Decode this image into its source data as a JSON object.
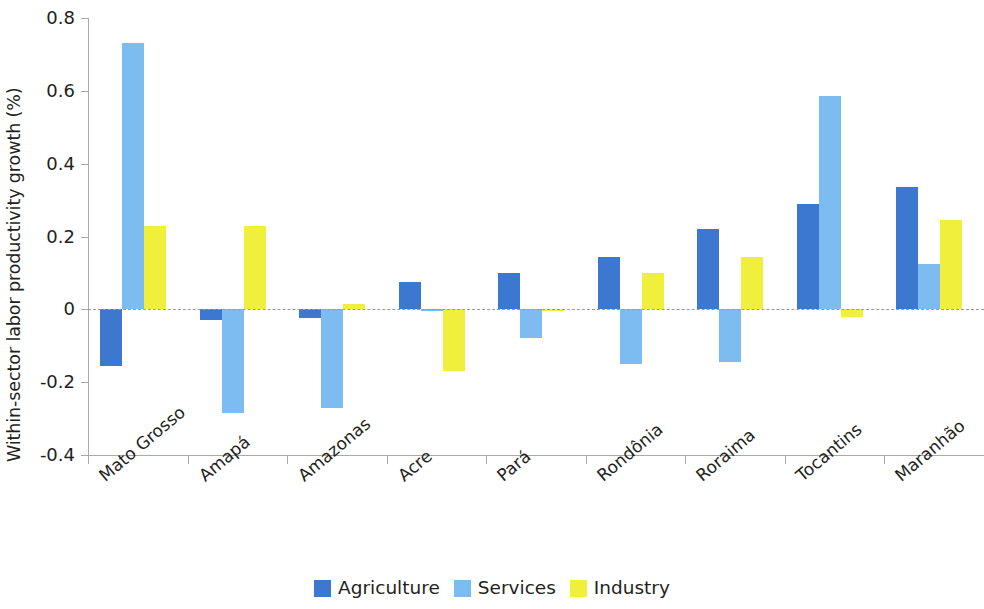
{
  "chart_data": {
    "type": "bar",
    "title": "",
    "xlabel": "",
    "ylabel": "Within-sector labor productivity growth (%)",
    "ylim": [
      -0.4,
      0.8
    ],
    "yticks": [
      0.8,
      0.6,
      0.4,
      0.2,
      0,
      -0.2,
      -0.4
    ],
    "ytick_labels": [
      "0.8",
      "0.6",
      "0.4",
      "0.2",
      "0",
      "-0.2",
      "-0.4"
    ],
    "grid": false,
    "zero_line": true,
    "legend_position": "bottom",
    "categories": [
      "Mato Grosso",
      "Amapá",
      "Amazonas",
      "Acre",
      "Pará",
      "Rondônia",
      "Roraima",
      "Tocantins",
      "Maranhão"
    ],
    "series": [
      {
        "name": "Agriculture",
        "color": "#3c78d0",
        "values": [
          -0.155,
          -0.03,
          -0.025,
          0.075,
          0.1,
          0.145,
          0.22,
          0.29,
          0.335
        ]
      },
      {
        "name": "Services",
        "color": "#7cbcf0",
        "values": [
          0.73,
          -0.285,
          -0.27,
          -0.005,
          -0.08,
          -0.15,
          -0.145,
          0.585,
          0.125
        ]
      },
      {
        "name": "Industry",
        "color": "#f0f03c",
        "values": [
          0.23,
          0.23,
          0.015,
          -0.17,
          -0.005,
          0.1,
          0.145,
          -0.02,
          0.245
        ]
      }
    ]
  }
}
